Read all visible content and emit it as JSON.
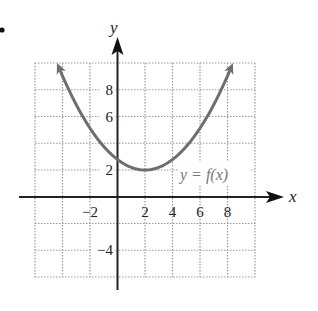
{
  "chart_data": {
    "type": "line",
    "title": "",
    "xlabel": "x",
    "ylabel": "y",
    "xlim": [
      -6,
      10
    ],
    "ylim": [
      -6,
      10
    ],
    "grid": true,
    "grid_step": 2,
    "x_ticks": [
      {
        "value": -2,
        "label": "−2"
      },
      {
        "value": 2,
        "label": "2"
      },
      {
        "value": 4,
        "label": "4"
      },
      {
        "value": 6,
        "label": "6"
      },
      {
        "value": 8,
        "label": "8"
      }
    ],
    "y_ticks": [
      {
        "value": 8,
        "label": "8"
      },
      {
        "value": 6,
        "label": "6"
      },
      {
        "value": 2,
        "label": "2"
      },
      {
        "value": -4,
        "label": "−4"
      }
    ],
    "series": [
      {
        "name": "y = f(x)",
        "description": "upward-opening parabola with vertex near (2, 2), arrows at both ends",
        "vertex": [
          2,
          2
        ],
        "x": [
          -4.4,
          -3,
          -2,
          -1,
          0,
          1,
          2,
          3,
          4,
          5,
          6,
          7,
          8.4
        ],
        "y": [
          10,
          6.88,
          5.12,
          3.76,
          2.78,
          2.2,
          2,
          2.2,
          2.78,
          3.76,
          5.12,
          6.88,
          10
        ],
        "color": "#6e6e6e"
      }
    ],
    "annotations": [
      {
        "text": "y = f(x)",
        "x": 6.5,
        "y": 2
      }
    ]
  },
  "labels": {
    "x_axis": "x",
    "y_axis": "y",
    "curve": "y = f(x)",
    "bullet": "•"
  },
  "colors": {
    "axis": "#222222",
    "grid": "#9a9a9a",
    "curve": "#6e6e6e",
    "curve_label": "#777777"
  }
}
